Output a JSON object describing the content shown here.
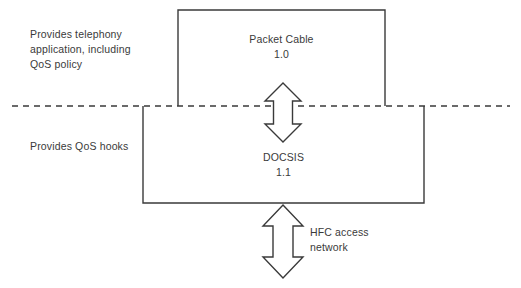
{
  "diagram": {
    "colors": {
      "stroke": "#3a3a3a",
      "text": "#3a3a3a",
      "background": "#ffffff"
    },
    "notes": {
      "upper_left": "Provides telephony\napplication, including\nQoS policy",
      "lower_left": "Provides QoS hooks"
    },
    "boxes": {
      "upper": {
        "name": "Packet Cable",
        "version": "1.0",
        "label": "Packet Cable\n1.0"
      },
      "lower": {
        "name": "DOCSIS",
        "version": "1.1",
        "label": "DOCSIS\n1.1"
      }
    },
    "arrows": {
      "upper": {
        "label": "",
        "direction": "bidirectional",
        "orientation": "vertical"
      },
      "lower": {
        "label": "HFC access\nnetwork",
        "direction": "bidirectional",
        "orientation": "vertical"
      }
    },
    "divider": {
      "style": "dashed",
      "orientation": "horizontal"
    }
  }
}
